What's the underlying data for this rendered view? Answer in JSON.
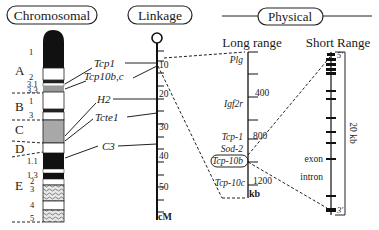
{
  "panels": {
    "chromosomal": "Chromosomal",
    "linkage": "Linkage",
    "physical": "Physical"
  },
  "chromosome": {
    "regions": [
      "A",
      "B",
      "C",
      "D",
      "E"
    ],
    "bands": [
      "1",
      "2",
      "3.1",
      "3.3",
      "1",
      "3",
      "1.1",
      "1.3",
      "2",
      "3",
      "4",
      "5"
    ]
  },
  "genes": {
    "tcp1": "Tcp1",
    "tcp10bc": "Tcp10b,c",
    "h2": "H2",
    "tcte1": "Tcte1",
    "c3": "C3"
  },
  "linkage_axis": {
    "ticks": [
      "10",
      "20",
      "30",
      "40",
      "50"
    ],
    "unit": "cM"
  },
  "long_range": {
    "title": "Long range",
    "genes": [
      "Plg",
      "Igf2r",
      "Tcp-1",
      "Sod-2",
      "Tcp-10b",
      "Tcp-10c"
    ],
    "ticks": [
      "400",
      "800",
      "1200"
    ],
    "unit": "kb"
  },
  "short_range": {
    "title": "Short Range",
    "five_prime": "5'",
    "three_prime": "3'",
    "exon_label": "exon",
    "intron_label": "intron",
    "span": "20 kb"
  }
}
